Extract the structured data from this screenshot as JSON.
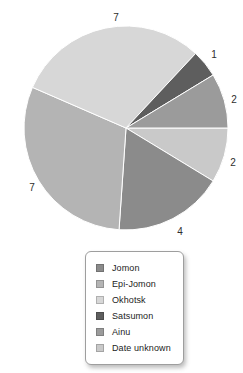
{
  "page": {
    "background": "#ffffff"
  },
  "chart_data": {
    "type": "pie",
    "title": "",
    "total": 23,
    "legend_position": "bottom-center-box",
    "slices": [
      {
        "label": "Jomon",
        "value": 4,
        "color": "#8b8b8b",
        "label_x": 180,
        "label_y": 231
      },
      {
        "label": "Epi-Jomon",
        "value": 7,
        "color": "#b4b4b4",
        "label_x": 32,
        "label_y": 187
      },
      {
        "label": "Okhotsk",
        "value": 7,
        "color": "#d7d7d7",
        "label_x": 116,
        "label_y": 17
      },
      {
        "label": "Satsumon",
        "value": 1,
        "color": "#5e5e5e",
        "label_x": 214,
        "label_y": 54
      },
      {
        "label": "Ainu",
        "value": 2,
        "color": "#9b9b9b",
        "label_x": 234,
        "label_y": 99
      },
      {
        "label": "Date unknown",
        "value": 2,
        "color": "#c9c9c9",
        "label_x": 233,
        "label_y": 162
      }
    ],
    "draw_sequence": [
      5,
      0,
      1,
      2,
      3,
      4
    ],
    "start_angle_deg": 0,
    "direction": "clockwise",
    "geometry": {
      "cx": 126,
      "cy": 128,
      "r": 102
    },
    "slice_stroke": "#ffffff",
    "value_label_color": "#2e2e2e"
  }
}
